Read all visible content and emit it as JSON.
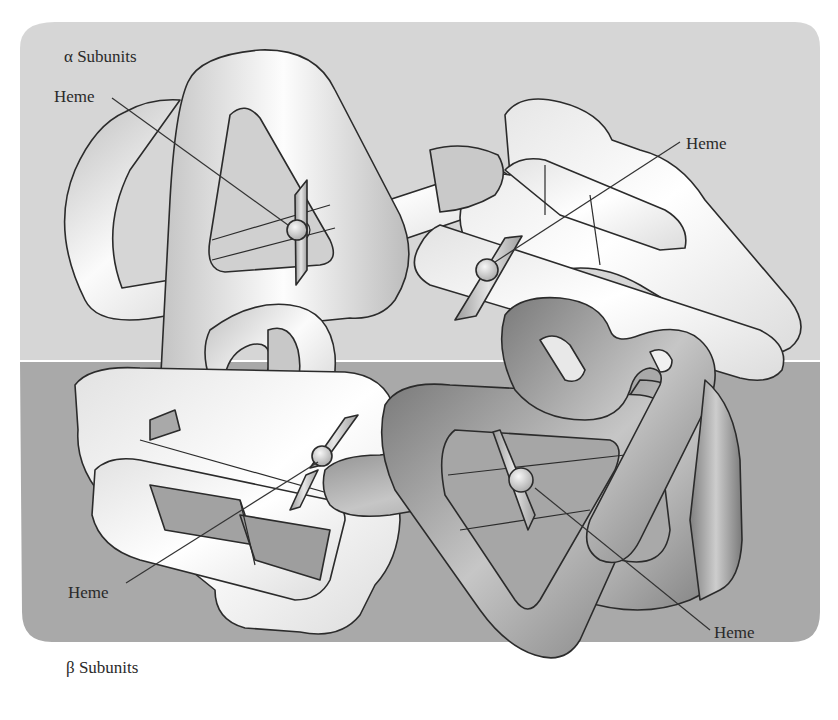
{
  "diagram": {
    "regions": {
      "alpha": {
        "label": "α Subunits",
        "color": "#d6d6d6"
      },
      "beta": {
        "label": "β Subunits",
        "color": "#a9a9a9"
      }
    },
    "chains": {
      "alpha_light_color": "#ececec",
      "beta_light_color": "#f2f2f2",
      "beta_dark_color": "#8f8f8f",
      "outline_color": "#2b2b2b"
    },
    "heme_labels": [
      {
        "id": "alpha-left",
        "text": "Heme"
      },
      {
        "id": "alpha-right",
        "text": "Heme"
      },
      {
        "id": "beta-left",
        "text": "Heme"
      },
      {
        "id": "beta-right",
        "text": "Heme"
      }
    ]
  }
}
